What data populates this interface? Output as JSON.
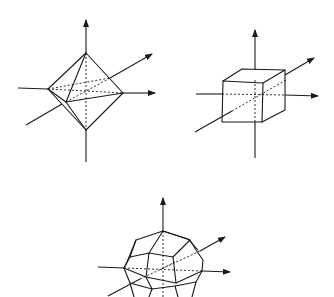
{
  "figure": {
    "ink_color": "#1a1a1a",
    "background": "#ffffff",
    "panels": [
      {
        "id": "octahedron",
        "shape": "octahedron",
        "position": "top-left"
      },
      {
        "id": "cube",
        "shape": "cube",
        "position": "top-right"
      },
      {
        "id": "pentagonal-polyhedron",
        "shape": "polyhedron with pentagonal faces (dodecahedron-like)",
        "position": "bottom-center"
      }
    ],
    "axes_per_panel": [
      "vertical axis (arrow up)",
      "horizontal axis (arrow right)",
      "oblique depth axis (arrow upper-right)"
    ]
  }
}
